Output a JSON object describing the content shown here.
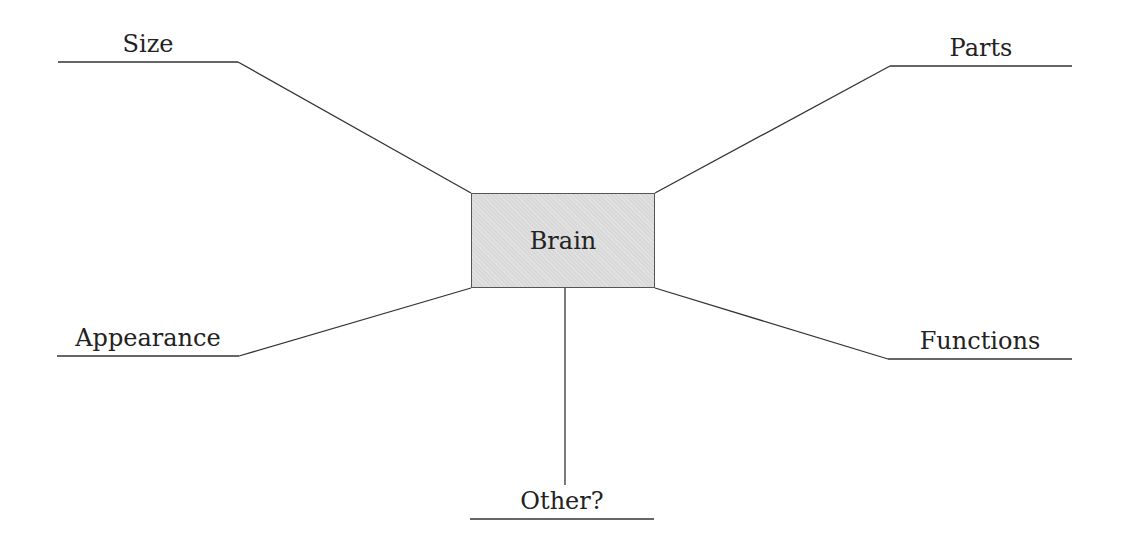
{
  "diagram": {
    "type": "mind-map",
    "center": {
      "label": "Brain"
    },
    "branches": [
      {
        "id": "size",
        "label": "Size"
      },
      {
        "id": "parts",
        "label": "Parts"
      },
      {
        "id": "appearance",
        "label": "Appearance"
      },
      {
        "id": "functions",
        "label": "Functions"
      },
      {
        "id": "other",
        "label": "Other?"
      }
    ]
  },
  "colors": {
    "line": "#333333",
    "box_fill": "#d9d9d9",
    "box_border": "#555555",
    "text": "#222222"
  }
}
